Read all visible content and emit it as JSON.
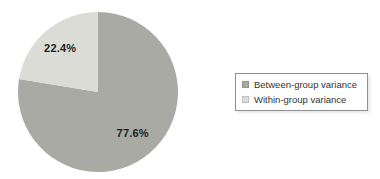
{
  "background_color": "#ffffff",
  "chart_data": {
    "type": "pie",
    "title": "",
    "slices": [
      {
        "label": "Between-group variance",
        "value": 77.6,
        "display": "77.6%",
        "color": "#a8aaa3"
      },
      {
        "label": "Within-group variance",
        "value": 22.4,
        "display": "22.4%",
        "color": "#dbdcd6"
      }
    ],
    "start_angle_deg": 0,
    "direction": "clockwise",
    "legend": {
      "position": "right",
      "border_color": "#8f8f8f",
      "background": "#ffffff"
    },
    "label_color": "#1c1c1c"
  }
}
